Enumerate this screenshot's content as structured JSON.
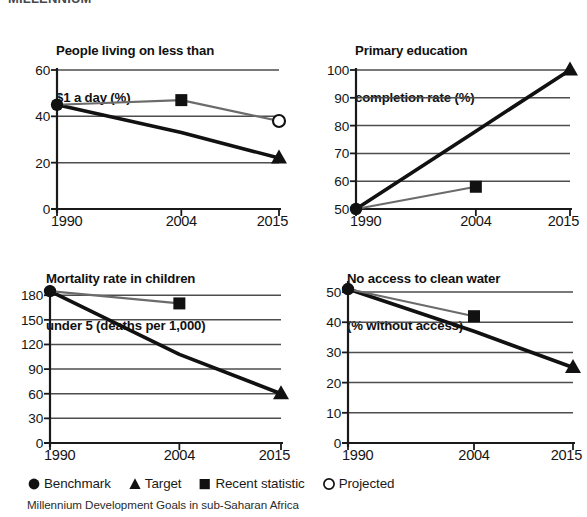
{
  "cut_off_header": "MILLENNIUM",
  "caption": "Millennium Development Goals in sub-Saharan Africa",
  "legend": {
    "items": [
      {
        "marker": "circle-filled",
        "label": "Benchmark"
      },
      {
        "marker": "triangle-filled",
        "label": "Target"
      },
      {
        "marker": "square-filled",
        "label": "Recent statistic"
      },
      {
        "marker": "circle-open",
        "label": "Projected"
      }
    ]
  },
  "colors": {
    "target_line": "#111111",
    "recent_line": "#6b6b6b",
    "axis": "#1a1a1a",
    "grid": "#4d4d4d",
    "background": "#ffffff"
  },
  "chart_data": [
    {
      "type": "line",
      "title": "People living on less than\n$1 a day (%)",
      "title_lines": [
        "People living on less than",
        "$1 a day (%)"
      ],
      "xlabel": "",
      "ylabel": "",
      "x": [
        "1990",
        "2004",
        "2015"
      ],
      "xticks": [
        "1990",
        "2004",
        "2015"
      ],
      "yticks": [
        0,
        20,
        40,
        60
      ],
      "ylim": [
        0,
        60
      ],
      "grid": true,
      "legend_position": "figure-bottom",
      "points": [
        {
          "x": "1990",
          "y": 45,
          "marker": "circle-filled",
          "series": "Benchmark"
        },
        {
          "x": "2004",
          "y": 47,
          "marker": "square-filled",
          "series": "Recent statistic"
        },
        {
          "x": "2015",
          "y": 38,
          "marker": "circle-open",
          "series": "Projected"
        },
        {
          "x": "2015",
          "y": 22,
          "marker": "triangle-filled",
          "series": "Target"
        }
      ],
      "series": [
        {
          "name": "Target",
          "style": "thick-black",
          "values": [
            45,
            33,
            22
          ]
        },
        {
          "name": "Recent statistic",
          "style": "thin-grey",
          "values": [
            45,
            47,
            38
          ]
        }
      ]
    },
    {
      "type": "line",
      "title": "Primary education\ncompletion rate (%)",
      "title_lines": [
        "Primary education",
        "completion rate (%)"
      ],
      "xlabel": "",
      "ylabel": "",
      "x": [
        "1990",
        "2004",
        "2015"
      ],
      "xticks": [
        "1990",
        "2004",
        "2015"
      ],
      "yticks": [
        50,
        60,
        70,
        80,
        90,
        100
      ],
      "ylim": [
        50,
        100
      ],
      "grid": true,
      "legend_position": "figure-bottom",
      "points": [
        {
          "x": "1990",
          "y": 50,
          "marker": "circle-filled",
          "series": "Benchmark"
        },
        {
          "x": "2004",
          "y": 58,
          "marker": "square-filled",
          "series": "Recent statistic"
        },
        {
          "x": "2015",
          "y": 100,
          "marker": "triangle-filled",
          "series": "Target"
        }
      ],
      "series": [
        {
          "name": "Target",
          "style": "thick-black",
          "values": [
            50,
            78,
            100
          ]
        },
        {
          "name": "Recent statistic",
          "style": "thin-grey",
          "values": [
            50,
            58,
            null
          ]
        }
      ]
    },
    {
      "type": "line",
      "title": "Mortality rate in children\nunder 5 (deaths per 1,000)",
      "title_lines": [
        "Mortality rate in children",
        "under 5 (deaths per 1,000)"
      ],
      "xlabel": "",
      "ylabel": "",
      "x": [
        "1990",
        "2004",
        "2015"
      ],
      "xticks": [
        "1990",
        "2004",
        "2015"
      ],
      "yticks": [
        0,
        30,
        60,
        90,
        120,
        150,
        180
      ],
      "ylim": [
        0,
        190
      ],
      "grid": true,
      "legend_position": "figure-bottom",
      "points": [
        {
          "x": "1990",
          "y": 185,
          "marker": "circle-filled",
          "series": "Benchmark"
        },
        {
          "x": "2004",
          "y": 170,
          "marker": "square-filled",
          "series": "Recent statistic"
        },
        {
          "x": "2015",
          "y": 60,
          "marker": "triangle-filled",
          "series": "Target"
        }
      ],
      "series": [
        {
          "name": "Target",
          "style": "thick-black",
          "values": [
            185,
            108,
            60
          ]
        },
        {
          "name": "Recent statistic",
          "style": "thin-grey",
          "values": [
            185,
            170,
            null
          ]
        }
      ]
    },
    {
      "type": "line",
      "title": "No access to clean water\n(% without access)",
      "title_lines": [
        "No access to clean water",
        "(% without access)"
      ],
      "xlabel": "",
      "ylabel": "",
      "x": [
        "1990",
        "2004",
        "2015"
      ],
      "xticks": [
        "1990",
        "2004",
        "2015"
      ],
      "yticks": [
        0,
        10,
        20,
        30,
        40,
        50
      ],
      "ylim": [
        0,
        53
      ],
      "grid": true,
      "legend_position": "figure-bottom",
      "points": [
        {
          "x": "1990",
          "y": 51,
          "marker": "circle-filled",
          "series": "Benchmark"
        },
        {
          "x": "2004",
          "y": 42,
          "marker": "square-filled",
          "series": "Recent statistic"
        },
        {
          "x": "2015",
          "y": 25,
          "marker": "triangle-filled",
          "series": "Target"
        }
      ],
      "series": [
        {
          "name": "Target",
          "style": "thick-black",
          "values": [
            51,
            37,
            25
          ]
        },
        {
          "name": "Recent statistic",
          "style": "thin-grey",
          "values": [
            51,
            42,
            null
          ]
        }
      ]
    }
  ]
}
